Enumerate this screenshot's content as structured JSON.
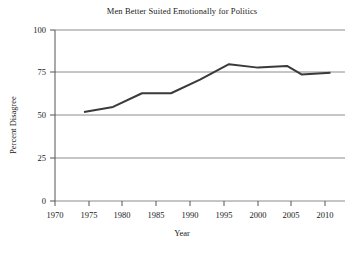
{
  "chart_data": {
    "type": "line",
    "title": "Men Better Suited Emotionally for Politics",
    "xlabel": "Year",
    "ylabel": "Percent Disagree",
    "xlim": [
      1970,
      2010
    ],
    "ylim": [
      0,
      100
    ],
    "grid": true,
    "legend": "none",
    "xticks": [
      1970,
      1975,
      1980,
      1985,
      1990,
      1995,
      2000,
      2005,
      2010
    ],
    "yticks": [
      0,
      25,
      50,
      75,
      100
    ],
    "xtick_labels": [
      "1970",
      "1975",
      "1980",
      "1985",
      "1990",
      "1995",
      "2000",
      "2005",
      "2010"
    ],
    "ytick_labels": [
      "0",
      "25",
      "50",
      "75",
      "100"
    ],
    "series": [
      {
        "name": "Percent Disagree",
        "color": "#3a3a3a",
        "x": [
          1974,
          1978,
          1982,
          1986,
          1990,
          1994,
          1998,
          2002,
          2004,
          2008
        ],
        "values": [
          52,
          55,
          63,
          63,
          71,
          80,
          78,
          79,
          74,
          75
        ]
      }
    ]
  },
  "axes": {
    "y_title": "Percent Disagree",
    "x_title": "Year"
  },
  "colors": {
    "line": "#3a3a3a",
    "grid": "#8c8c8c",
    "axis": "#555555",
    "background": "#ffffff",
    "text": "#1a1a1a"
  }
}
